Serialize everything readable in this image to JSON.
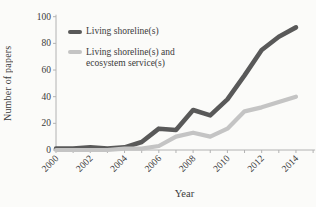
{
  "figure": {
    "background": "#fbfbf9",
    "axis_color": "#b2b2b2",
    "text_color": "#3a3a3a"
  },
  "chart_data": {
    "type": "line",
    "title": "",
    "xlabel": "Year",
    "ylabel": "Number of papers",
    "x": [
      2000,
      2001,
      2002,
      2003,
      2004,
      2005,
      2006,
      2007,
      2008,
      2009,
      2010,
      2011,
      2012,
      2013,
      2014
    ],
    "xtick_label_years": [
      2000,
      2002,
      2004,
      2006,
      2008,
      2010,
      2012,
      2014
    ],
    "xtick_labels": [
      "2000",
      "2002",
      "2004",
      "2006",
      "2008",
      "2010",
      "2012",
      "2014"
    ],
    "ylim": [
      0,
      100
    ],
    "yticks": [
      0,
      20,
      40,
      60,
      80,
      100
    ],
    "grid": false,
    "legend_position": "inside-top-left",
    "series": [
      {
        "name": "Living shoreline(s)",
        "color": "#595959",
        "stroke_width": 4.6,
        "values": [
          1,
          1,
          2,
          1,
          2,
          6,
          16,
          15,
          30,
          26,
          38,
          56,
          75,
          85,
          92
        ]
      },
      {
        "name": "Living shoreline(s) and ecosystem service(s)",
        "color": "#c4c4c4",
        "stroke_width": 4.2,
        "values": [
          0,
          0,
          0,
          0,
          1,
          1,
          3,
          10,
          13,
          10,
          16,
          29,
          32,
          36,
          40
        ]
      }
    ]
  },
  "legend": {
    "entry1": "Living shoreline(s)",
    "entry2_line1": "Living shoreline(s) and",
    "entry2_line2": "ecosystem service(s)"
  }
}
